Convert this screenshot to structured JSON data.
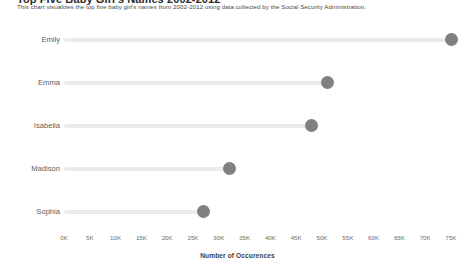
{
  "header": {
    "title": "Top Five Baby Girl's Names 2002-2012",
    "subtitle": "This chart visualizes the top five baby girl's names from 2002-2012 using data collected by the Social Security Administration."
  },
  "axis": {
    "title": "Number of Occurences",
    "ticks": [
      "0K",
      "5K",
      "10K",
      "15K",
      "20K",
      "25K",
      "30K",
      "35K",
      "40K",
      "45K",
      "50K",
      "55K",
      "60K",
      "65K",
      "70K",
      "75K"
    ]
  },
  "colors": {
    "dot": "#808080",
    "stem": "#ebebeb",
    "label": "#5b5b5b"
  },
  "chart_data": {
    "type": "bar",
    "subtype": "lollipop-horizontal",
    "title": "Top Five Baby Girl's Names 2002-2012",
    "subtitle": "This chart visualizes the top five baby girl's names from 2002-2012 using data collected by the Social Security Administration.",
    "xlabel": "Number of Occurences",
    "ylabel": "",
    "orientation": "horizontal",
    "grid": false,
    "legend": "none",
    "xlim": [
      0,
      77000
    ],
    "xticks": [
      0,
      5000,
      10000,
      15000,
      20000,
      25000,
      30000,
      35000,
      40000,
      45000,
      50000,
      55000,
      60000,
      65000,
      70000,
      75000
    ],
    "xtick_labels": [
      "0K",
      "5K",
      "10K",
      "15K",
      "20K",
      "25K",
      "30K",
      "35K",
      "40K",
      "45K",
      "50K",
      "55K",
      "60K",
      "65K",
      "70K",
      "75K"
    ],
    "categories": [
      "Emily",
      "Emma",
      "Isabella",
      "Madison",
      "Sophia"
    ],
    "values": [
      75000,
      51000,
      48000,
      32000,
      27000
    ]
  }
}
